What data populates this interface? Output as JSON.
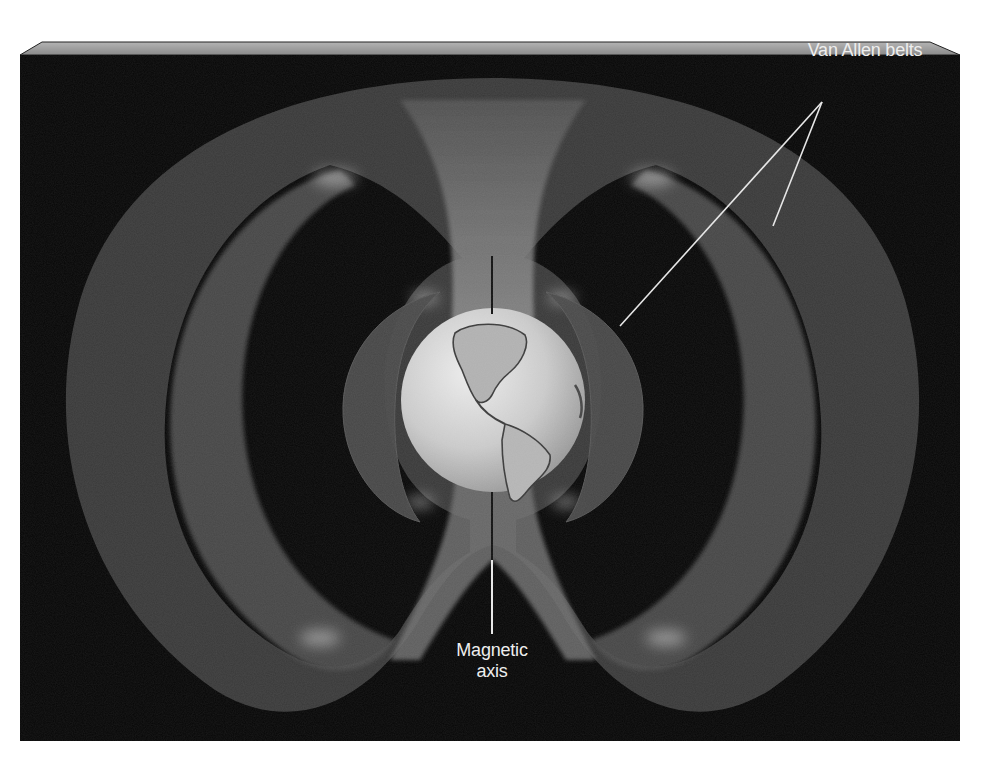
{
  "figure": {
    "background_color": "#000000",
    "panel_bevel_color": "#9a9a9a",
    "belt_color": "#5a5a5a",
    "earth_color": "#cfcfcf"
  },
  "labels": {
    "van_allen_belts": "Van Allen belts",
    "magnetic_axis_line1": "Magnetic",
    "magnetic_axis_line2": "axis"
  },
  "elements": {
    "earth": "Earth (globe showing the Americas)",
    "inner_belt": "Inner Van Allen belt",
    "outer_belt": "Outer Van Allen belt",
    "magnetic_axis": "Magnetic axis line"
  }
}
